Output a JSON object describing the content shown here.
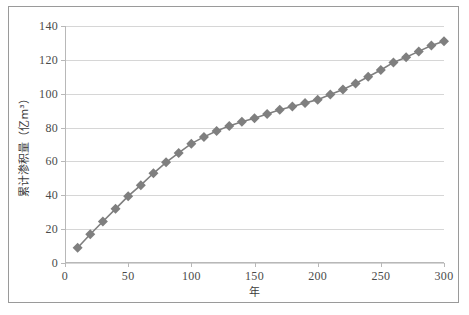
{
  "figure": {
    "background_color": "#ffffff",
    "frame_color": "#9a9a9a"
  },
  "chart_data": {
    "type": "line",
    "title": "",
    "subtitle": "",
    "xlabel": "年",
    "ylabel": "累计渗积量（亿m³）",
    "xlim": [
      0,
      300
    ],
    "ylim": [
      0,
      140
    ],
    "xticks": [
      0,
      50,
      100,
      150,
      200,
      250,
      300
    ],
    "yticks": [
      0,
      20,
      40,
      60,
      80,
      100,
      120,
      140
    ],
    "xtick_labels": [
      "0",
      "50",
      "100",
      "150",
      "200",
      "250",
      "300"
    ],
    "ytick_labels": [
      "0",
      "20",
      "40",
      "60",
      "80",
      "100",
      "120",
      "140"
    ],
    "grid": "horizontal",
    "legend": "none",
    "series_color": "#7f7f7f",
    "marker": "diamond",
    "marker_size": 5,
    "line_width": 1.6,
    "x": [
      10,
      20,
      30,
      40,
      50,
      60,
      70,
      80,
      90,
      100,
      110,
      120,
      130,
      140,
      150,
      160,
      170,
      180,
      190,
      200,
      210,
      220,
      230,
      240,
      250,
      260,
      270,
      280,
      290,
      300
    ],
    "series": [
      {
        "name": "累计渗积量",
        "values": [
          9,
          17,
          24.5,
          32,
          39.5,
          46,
          53,
          59.5,
          65,
          70.5,
          74.5,
          78,
          81,
          83.5,
          85.5,
          88,
          90.5,
          92.5,
          94.5,
          96.5,
          99.5,
          102.5,
          106,
          110,
          114,
          118.5,
          121.5,
          125,
          128.5,
          131
        ]
      }
    ]
  }
}
